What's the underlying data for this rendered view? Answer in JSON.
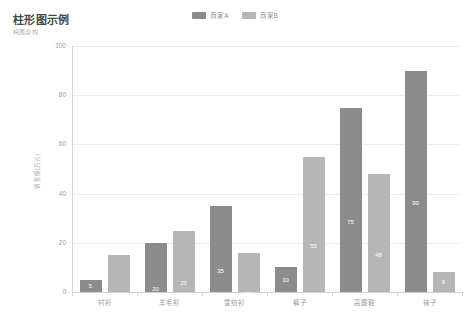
{
  "header": {
    "title": "柱形图示例",
    "subtitle": "纯属虚构"
  },
  "colors": {
    "series_a": "#8c8c8c",
    "series_b": "#b6b6b6",
    "grid": "#eeeeee",
    "axis": "#d4d4d4",
    "axis_text": "#9a9a9a",
    "title_text": "#464646",
    "value_label": "#ffffff"
  },
  "legend": {
    "position": "top-center",
    "items": [
      {
        "label": "商家A",
        "color": "#8c8c8c",
        "name": "legend-series-a"
      },
      {
        "label": "商家B",
        "color": "#b6b6b6",
        "name": "legend-series-b"
      }
    ]
  },
  "chart_data": {
    "type": "bar",
    "title": "柱形图示例",
    "subtitle": "纯属虚构",
    "xlabel": "",
    "ylabel": "销售额(万元)",
    "categories": [
      "衬衫",
      "羊毛衫",
      "雪纺衫",
      "裤子",
      "高跟鞋",
      "袜子"
    ],
    "series": [
      {
        "name": "商家A",
        "color": "#8c8c8c",
        "values": [
          5,
          20,
          35,
          10,
          75,
          90
        ]
      },
      {
        "name": "商家B",
        "color": "#b6b6b6",
        "values": [
          15,
          25,
          16,
          55,
          48,
          8
        ]
      }
    ],
    "ylim": [
      0,
      100
    ],
    "yticks": [
      0,
      20,
      40,
      60,
      80,
      100
    ],
    "grid": true,
    "legend_position": "top-center",
    "value_labels": true,
    "value_label_position": "inside"
  }
}
